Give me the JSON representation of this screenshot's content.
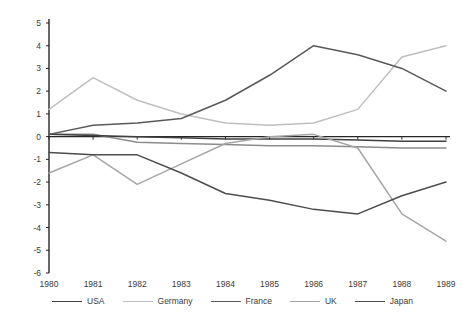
{
  "chart_data": {
    "type": "line",
    "title": "",
    "subtitle": "",
    "xlabel": "",
    "ylabel": "",
    "x": [
      1980,
      1981,
      1982,
      1983,
      1984,
      1985,
      1986,
      1987,
      1988,
      1989
    ],
    "categories": [
      "1980",
      "1981",
      "1982",
      "1983",
      "1984",
      "1985",
      "1986",
      "1987",
      "1988",
      "1989"
    ],
    "ylim": [
      -6,
      5
    ],
    "yticks": [
      5,
      4,
      3,
      2,
      1,
      0,
      -1,
      -2,
      -3,
      -4,
      -5,
      -6
    ],
    "ytick_labels": [
      "5",
      "4",
      "3",
      "2",
      "1",
      "0",
      "-1",
      "-2",
      "-3",
      "-4",
      "-5",
      "-6"
    ],
    "grid": false,
    "legend_position": "bottom",
    "series": [
      {
        "name": "USA",
        "color": "#404040",
        "values": [
          0.1,
          0.05,
          0.0,
          -0.05,
          -0.1,
          -0.1,
          -0.1,
          -0.15,
          -0.2,
          -0.2
        ]
      },
      {
        "name": "Germany",
        "color": "#bfbfbf",
        "values": [
          1.2,
          2.6,
          1.6,
          1.0,
          0.6,
          0.5,
          0.6,
          1.2,
          3.5,
          4.0
        ]
      },
      {
        "name": "France",
        "color": "#595959",
        "values": [
          0.1,
          0.5,
          0.6,
          0.8,
          1.6,
          2.7,
          4.0,
          3.6,
          3.0,
          2.0
        ]
      },
      {
        "name": "UK",
        "color": "#a6a6a6",
        "values": [
          -1.6,
          -0.8,
          -2.1,
          -1.2,
          -0.3,
          0.0,
          0.1,
          -0.5,
          -3.4,
          -4.6
        ]
      },
      {
        "name": "Japan",
        "color": "#4d4d4d",
        "values": [
          -0.7,
          -0.8,
          -0.8,
          -1.6,
          -2.5,
          -2.8,
          -3.2,
          -3.4,
          -2.6,
          -2.0
        ]
      }
    ],
    "secondary_series": [
      {
        "name": "USA-flat-overlay",
        "color": "#8c8c8c",
        "values": [
          0.1,
          0.1,
          -0.25,
          -0.3,
          -0.35,
          -0.4,
          -0.4,
          -0.45,
          -0.5,
          -0.5
        ]
      }
    ]
  },
  "legend": {
    "items": [
      {
        "label": "USA",
        "color": "#404040"
      },
      {
        "label": "Germany",
        "color": "#bfbfbf"
      },
      {
        "label": "France",
        "color": "#595959"
      },
      {
        "label": "UK",
        "color": "#a6a6a6"
      },
      {
        "label": "Japan",
        "color": "#4d4d4d"
      }
    ]
  },
  "axis": {
    "color": "#262626"
  }
}
